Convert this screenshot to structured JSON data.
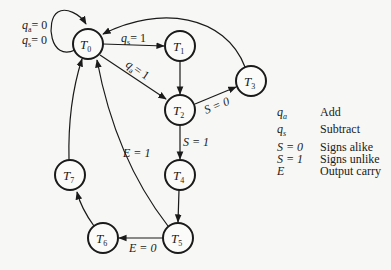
{
  "diagram": {
    "type": "state-diagram",
    "nodes": [
      {
        "id": "T0",
        "label": "T",
        "sub": "0",
        "x": 88,
        "y": 44
      },
      {
        "id": "T1",
        "label": "T",
        "sub": "1",
        "x": 180,
        "y": 46
      },
      {
        "id": "T2",
        "label": "T",
        "sub": "2",
        "x": 180,
        "y": 110
      },
      {
        "id": "T3",
        "label": "T",
        "sub": "3",
        "x": 251,
        "y": 81
      },
      {
        "id": "T4",
        "label": "T",
        "sub": "4",
        "x": 180,
        "y": 175
      },
      {
        "id": "T5",
        "label": "T",
        "sub": "5",
        "x": 178,
        "y": 238
      },
      {
        "id": "T6",
        "label": "T",
        "sub": "6",
        "x": 103,
        "y": 238
      },
      {
        "id": "T7",
        "label": "T",
        "sub": "7",
        "x": 70,
        "y": 175
      }
    ],
    "edges": [
      {
        "from": "T0",
        "to": "T0",
        "label_lines": [
          "qa = 0",
          "qs = 0"
        ]
      },
      {
        "from": "T0",
        "to": "T1",
        "label": "qs = 1"
      },
      {
        "from": "T0",
        "to": "T2",
        "label": "qa = 1"
      },
      {
        "from": "T1",
        "to": "T2",
        "label": ""
      },
      {
        "from": "T2",
        "to": "T3",
        "label": "S = 0"
      },
      {
        "from": "T3",
        "to": "T0",
        "label": ""
      },
      {
        "from": "T2",
        "to": "T4",
        "label": "S = 1"
      },
      {
        "from": "T4",
        "to": "T5",
        "label": ""
      },
      {
        "from": "T5",
        "to": "T0",
        "label": "E = 1"
      },
      {
        "from": "T5",
        "to": "T6",
        "label": "E = 0"
      },
      {
        "from": "T6",
        "to": "T7",
        "label": ""
      },
      {
        "from": "T7",
        "to": "T0",
        "label": ""
      }
    ],
    "edge_labels": {
      "self_qa": "= 0",
      "self_qs": "= 0",
      "t0_t1": "= 1",
      "t0_t2": "= 1",
      "t2_t3": "S = 0",
      "t2_t4": "S = 1",
      "t5_t0": "E = 1",
      "t5_t6": "E = 0"
    }
  },
  "legend": {
    "items": [
      {
        "symbol": "qa",
        "symbol_main": "q",
        "symbol_sub": "a",
        "description": "Add"
      },
      {
        "symbol": "qs",
        "symbol_main": "q",
        "symbol_sub": "s",
        "description": "Subtract"
      },
      {
        "symbol": "S = 0",
        "symbol_main": "S = 0",
        "symbol_sub": "",
        "description": "Signs alike"
      },
      {
        "symbol": "S = 1",
        "symbol_main": "S = 1",
        "symbol_sub": "",
        "description": "Signs unlike"
      },
      {
        "symbol": "E",
        "symbol_main": "E",
        "symbol_sub": "",
        "description": "Output carry"
      }
    ]
  }
}
